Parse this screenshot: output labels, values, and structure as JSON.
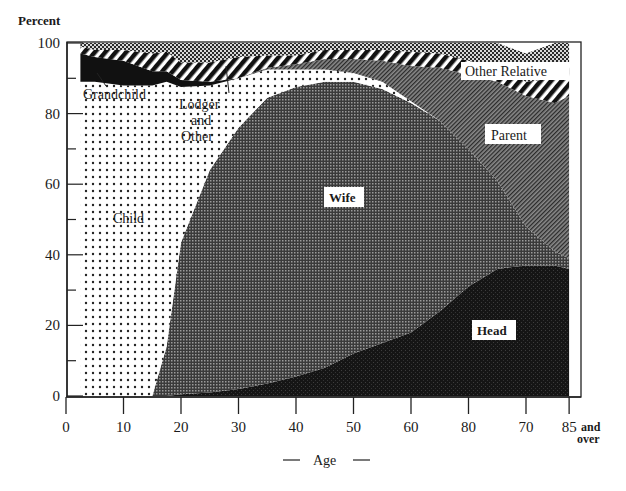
{
  "chart_data": {
    "type": "area",
    "stacked": true,
    "title": "",
    "xlabel": "— Age —",
    "ylabel": "Percent",
    "ylim": [
      0,
      100
    ],
    "xlim": [
      0,
      88
    ],
    "grid": false,
    "legend": "inline labels",
    "y_ticks": [
      "0",
      "20",
      "40",
      "60",
      "80",
      "100"
    ],
    "x_ticks": [
      "0",
      "10",
      "20",
      "30",
      "40",
      "50",
      "60",
      "80",
      "70",
      "85"
    ],
    "x_tick_suffix": [
      "and",
      "over"
    ],
    "x": [
      2.5,
      5,
      10,
      15,
      17.5,
      20,
      25,
      30,
      35,
      40,
      45,
      50,
      55,
      60,
      65,
      70,
      75,
      80,
      85,
      87.5
    ],
    "series": [
      {
        "name": "Head",
        "values": [
          0,
          0,
          0,
          0,
          0,
          0.5,
          1,
          2,
          3.5,
          5.5,
          8,
          12,
          15,
          18,
          24,
          31,
          36,
          37,
          37,
          36
        ]
      },
      {
        "name": "Wife",
        "values": [
          0,
          0,
          0,
          0,
          14,
          43,
          63,
          74,
          81,
          82,
          81,
          77,
          72,
          65,
          54,
          39,
          25,
          11,
          4,
          3
        ]
      },
      {
        "name": "Child",
        "values": [
          86,
          87,
          86,
          85,
          72,
          30,
          10,
          3,
          1,
          0,
          0,
          0,
          0,
          0,
          0,
          0,
          0,
          0,
          0,
          0
        ]
      },
      {
        "name": "Lodger and Other",
        "values": [
          3,
          2,
          2,
          3,
          3,
          14,
          14,
          11,
          7,
          5,
          3.5,
          2.5,
          2,
          0.5,
          0,
          0,
          0,
          0,
          0,
          0
        ]
      },
      {
        "name": "Parent",
        "values": [
          0,
          0,
          0,
          0,
          0,
          0,
          0,
          0,
          0.5,
          1.5,
          3,
          4,
          6,
          10,
          15,
          21,
          28,
          37,
          42,
          46
        ]
      },
      {
        "name": "Grandchild",
        "values": [
          8,
          7,
          7,
          4,
          3,
          2,
          1,
          0,
          0,
          0,
          0,
          0,
          0,
          0,
          0,
          0,
          0,
          0,
          0,
          0
        ]
      },
      {
        "name": "Other Relative",
        "values": [
          2,
          2,
          3,
          5,
          5.5,
          5,
          5.5,
          6,
          3.5,
          2.5,
          2.5,
          2.5,
          3,
          4,
          4,
          4,
          4,
          4,
          7,
          9
        ]
      },
      {
        "name": "Top band (unlabeled)",
        "values": [
          1,
          2,
          2,
          3,
          2.5,
          5.5,
          5.5,
          4,
          3.5,
          3.5,
          2,
          2,
          2,
          2.5,
          3,
          5,
          7,
          8,
          10,
          6
        ]
      }
    ],
    "annotations": [
      "Grandchild",
      "Lodger and Other",
      "Child",
      "Wife",
      "Other Relative",
      "Parent",
      "Head"
    ]
  },
  "labels": {
    "y_axis_title": "Percent",
    "x_axis_title": "Age",
    "x_axis_dash": "—",
    "grandchild": "Grandchild",
    "lodger_1": "Lodger",
    "lodger_2": "and",
    "lodger_3": "Other",
    "child": "Child",
    "wife": "Wife",
    "other_relative": "Other Relative",
    "parent": "Parent",
    "head": "Head",
    "and": "and",
    "over": "over"
  }
}
